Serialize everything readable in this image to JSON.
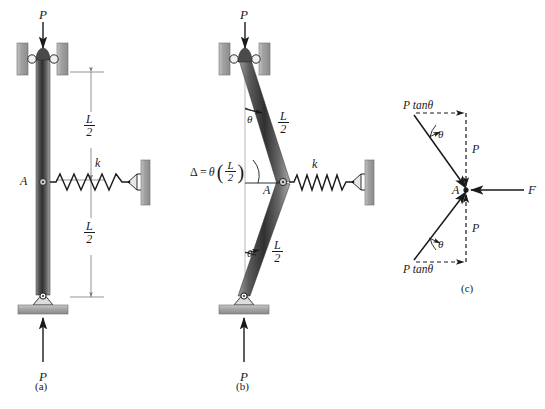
{
  "figure": {
    "colors": {
      "member_dark": "#3a3a3a",
      "member_mid": "#6e6e6e",
      "member_light": "#b9b9b9",
      "support_gray": "#a8a8a8",
      "support_gray_dark": "#8d8d8d",
      "line": "#1a1a1a",
      "dim_line": "#7a7a7a",
      "background": "#ffffff"
    }
  },
  "panels": [
    {
      "id": "a",
      "caption": "(a)",
      "description": "Straight column, pinned at base, guided roller at top, spring at mid-height A",
      "labels": {
        "load_top": "P",
        "load_bottom": "P",
        "point_a": "A",
        "spring_constant": "k",
        "dim_upper_num": "L",
        "dim_upper_den": "2",
        "dim_lower_num": "L",
        "dim_lower_den": "2"
      }
    },
    {
      "id": "b",
      "caption": "(b)",
      "description": "Buckled (deflected) configuration with rotation theta of each half and lateral displacement Delta at A",
      "labels": {
        "load_top": "P",
        "load_bottom": "P",
        "point_a": "A",
        "spring_constant": "k",
        "theta_upper": "θ",
        "theta_lower": "θ",
        "delta_lhs": "Δ =",
        "delta_theta": "θ",
        "delta_num": "L",
        "delta_den": "2",
        "dim_upper_num": "L",
        "dim_upper_den": "2",
        "dim_lower_num": "L",
        "dim_lower_den": "2"
      }
    },
    {
      "id": "c",
      "caption": "(c)",
      "description": "Free-body diagram of joint A showing axial forces P, transverse components P tan theta, and spring force F",
      "labels": {
        "top_force": "P tanθ",
        "bottom_force": "P tanθ",
        "axial_upper": "P",
        "axial_lower": "P",
        "theta_upper": "θ",
        "theta_lower": "θ",
        "point_a": "A",
        "spring_force": "F"
      }
    }
  ]
}
